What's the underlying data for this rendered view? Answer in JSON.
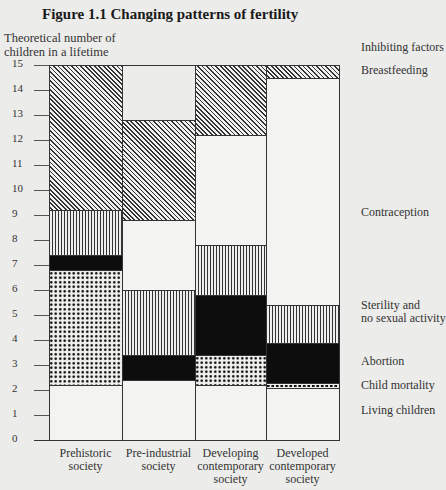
{
  "chart_data": {
    "type": "stacked-bar",
    "title": "Figure 1.1 Changing patterns of fertility",
    "ylabel": "Theoretical number of children in a lifetime",
    "xlabel": "",
    "ylim": [
      0,
      15
    ],
    "yticks": [
      "0",
      "1",
      "2",
      "3",
      "4",
      "5",
      "6",
      "7",
      "8",
      "9",
      "10",
      "11",
      "12",
      "13",
      "14",
      "15"
    ],
    "legend_title": "Inhibiting factors",
    "categories": [
      "Prehistoric society",
      "Pre-industrial society",
      "Developing contemporary society",
      "Developed contemporary society"
    ],
    "category_lines": [
      [
        "Prehistoric",
        "society"
      ],
      [
        "Pre-industrial",
        "society"
      ],
      [
        "Developing",
        "contemporary",
        "society"
      ],
      [
        "Developed",
        "contemporary",
        "society"
      ]
    ],
    "series": [
      {
        "name": "Living children",
        "pattern": "blank",
        "values": [
          2.2,
          2.4,
          2.2,
          2.1
        ]
      },
      {
        "name": "Child mortality",
        "pattern": "dots",
        "values": [
          4.6,
          0,
          1.2,
          0.2
        ]
      },
      {
        "name": "Abortion",
        "pattern": "black",
        "values": [
          0.6,
          1.0,
          2.4,
          1.6
        ]
      },
      {
        "name": "Sterility and no sexual activity",
        "pattern": "vertical-lines",
        "values": [
          1.8,
          2.6,
          2.0,
          1.5
        ]
      },
      {
        "name": "Contraception",
        "pattern": "blank",
        "values": [
          0,
          2.8,
          4.4,
          9.1
        ]
      },
      {
        "name": "Breastfeeding",
        "pattern": "diagonal-lines",
        "values": [
          5.8,
          4.0,
          2.8,
          0.5
        ]
      }
    ],
    "cumulative_tops": [
      [
        2.2,
        6.8,
        7.4,
        9.2,
        9.2,
        15
      ],
      [
        2.4,
        2.4,
        4.6,
        5.6,
        8.2,
        15
      ],
      [
        2.2,
        3.4,
        5.8,
        7.8,
        12.2,
        15
      ],
      [
        2.1,
        2.3,
        3.9,
        5.4,
        14.5,
        15
      ]
    ],
    "total": 15,
    "grid": false,
    "legend_position": "right"
  },
  "legend": {
    "title": "Inhibiting factors",
    "items": [
      {
        "label": "Breastfeeding"
      },
      {
        "label": "Contraception"
      },
      {
        "label": "Sterility and",
        "label2": "no sexual activity"
      },
      {
        "label": "Abortion"
      },
      {
        "label": "Child mortality"
      },
      {
        "label": "Living children"
      }
    ]
  }
}
